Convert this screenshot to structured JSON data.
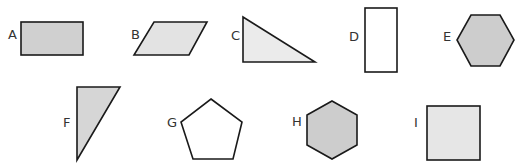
{
  "figure": {
    "type": "shape-identification",
    "shapes": [
      {
        "label": "A",
        "kind": "rectangle",
        "fill": "#d0d0d0"
      },
      {
        "label": "B",
        "kind": "parallelogram",
        "fill": "#e3e3e3"
      },
      {
        "label": "C",
        "kind": "right-triangle",
        "fill": "#ebebeb"
      },
      {
        "label": "D",
        "kind": "rectangle",
        "fill": "#ffffff"
      },
      {
        "label": "E",
        "kind": "hexagon",
        "fill": "#cdcdcd"
      },
      {
        "label": "F",
        "kind": "right-triangle",
        "fill": "#d6d6d6"
      },
      {
        "label": "G",
        "kind": "pentagon",
        "fill": "#ffffff"
      },
      {
        "label": "H",
        "kind": "hexagon",
        "fill": "#cdcdcd"
      },
      {
        "label": "I",
        "kind": "square",
        "fill": "#e6e6e6"
      }
    ]
  }
}
